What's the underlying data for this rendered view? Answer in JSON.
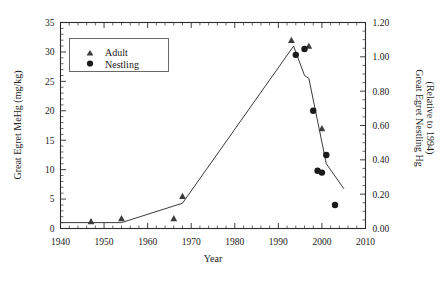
{
  "chart_data": {
    "type": "scatter",
    "title": "",
    "xlabel": "Year",
    "ylabel": "Great Egret MeHg (mg/kg)",
    "y2label_line1": "Great Egret Nestling Hg",
    "y2label_line2": "(Relative to 1994)",
    "xlim": [
      1940,
      2010
    ],
    "ylim": [
      0,
      35
    ],
    "y2lim": [
      0.0,
      1.2
    ],
    "grid": false,
    "legend_position": "upper-left-inside",
    "xticks": [
      1940,
      1950,
      1960,
      1970,
      1980,
      1990,
      2000,
      2010
    ],
    "xticklabels": [
      "1940",
      "1950",
      "1960",
      "1970",
      "1980",
      "1990",
      "2000",
      "2010"
    ],
    "x_minor_tick_interval": 2,
    "yticks": [
      0,
      5,
      10,
      15,
      20,
      25,
      30,
      35
    ],
    "yticklabels": [
      "0",
      "5",
      "10",
      "15",
      "20",
      "25",
      "30",
      "35"
    ],
    "y_minor_tick_interval": 1,
    "y2ticks": [
      0.0,
      0.2,
      0.4,
      0.6,
      0.8,
      1.0,
      1.2
    ],
    "y2ticklabels": [
      "0.00",
      "0.20",
      "0.40",
      "0.60",
      "0.80",
      "1.00",
      "1.20"
    ],
    "series": [
      {
        "name": "Adult",
        "marker": "triangle",
        "axis": "left",
        "points": [
          {
            "x": 1947,
            "y": 1.2
          },
          {
            "x": 1954,
            "y": 1.7
          },
          {
            "x": 1966,
            "y": 1.7
          },
          {
            "x": 1968,
            "y": 5.5
          },
          {
            "x": 1993,
            "y": 32.0
          },
          {
            "x": 1997,
            "y": 31.0
          },
          {
            "x": 2000,
            "y": 17.0
          }
        ]
      },
      {
        "name": "Nestling",
        "marker": "circle",
        "axis": "left",
        "points": [
          {
            "x": 1994,
            "y": 29.5
          },
          {
            "x": 1996,
            "y": 30.5
          },
          {
            "x": 1998,
            "y": 20.0
          },
          {
            "x": 1999,
            "y": 9.8
          },
          {
            "x": 2000,
            "y": 9.5
          },
          {
            "x": 2001,
            "y": 12.5
          },
          {
            "x": 2003,
            "y": 4.0
          }
        ]
      },
      {
        "name": "Modeled trend",
        "marker": "line",
        "axis": "left",
        "points": [
          {
            "x": 1940,
            "y": 1.0
          },
          {
            "x": 1954,
            "y": 1.0
          },
          {
            "x": 1968,
            "y": 4.3
          },
          {
            "x": 1993.5,
            "y": 31.0
          },
          {
            "x": 1996,
            "y": 26.0
          },
          {
            "x": 1997,
            "y": 25.5
          },
          {
            "x": 2001,
            "y": 11.0
          },
          {
            "x": 2005,
            "y": 6.8
          }
        ]
      }
    ],
    "legend": [
      {
        "label": "Adult",
        "marker": "triangle"
      },
      {
        "label": "Nestling",
        "marker": "circle"
      }
    ]
  }
}
